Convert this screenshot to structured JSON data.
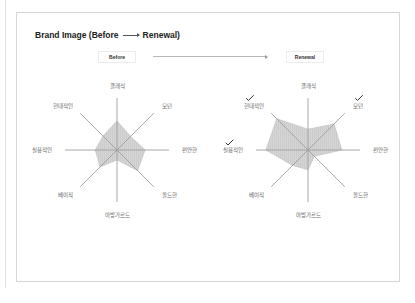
{
  "header": {
    "title_prefix": "Brand Image (Before",
    "title_suffix": "Renewal)",
    "before_tag": "Before",
    "renewal_tag": "Renewal"
  },
  "colors": {
    "axis": "#9e9e9e",
    "fill": "#d5d5d5",
    "fill_stroke": "#bdbdbd",
    "check": "#333333"
  },
  "chart_data": [
    {
      "type": "radar",
      "title": "Before",
      "axes": [
        "클래식",
        "모던",
        "편안한",
        "올드한",
        "아방가르드",
        "베이직",
        "실용적인",
        "현대적인"
      ],
      "values": [
        56,
        37,
        54,
        56,
        19,
        46,
        42,
        38
      ],
      "range": [
        0,
        100
      ],
      "grid": false
    },
    {
      "type": "radar",
      "title": "Renewal",
      "axes": [
        "클래식",
        "모던",
        "편안한",
        "올드한",
        "아방가르드",
        "베이직",
        "실용적인",
        "현대적인"
      ],
      "values": [
        40,
        71,
        65,
        17,
        38,
        42,
        81,
        85
      ],
      "highlighted": [
        "모던",
        "실용적인",
        "현대적인"
      ],
      "range": [
        0,
        100
      ],
      "grid": false
    }
  ]
}
